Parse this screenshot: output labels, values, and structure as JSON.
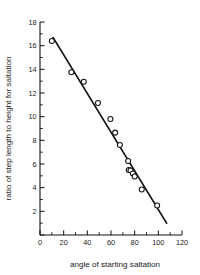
{
  "chart_data": {
    "type": "scatter",
    "title": "",
    "xlabel": "angle of starting saltation",
    "ylabel": "ratio of step length to height for saltation",
    "xlim": [
      0,
      120
    ],
    "ylim": [
      0,
      18
    ],
    "xticks": [
      0,
      20,
      40,
      60,
      80,
      100,
      120
    ],
    "xtick_labels": [
      "0",
      "20",
      "40",
      "60",
      "80",
      "100",
      "120"
    ],
    "xminor_step": 10,
    "yticks": [
      0,
      2,
      4,
      6,
      8,
      10,
      12,
      14,
      16,
      18
    ],
    "ytick_labels": [
      "0",
      "2",
      "4",
      "6",
      "8",
      "10",
      "12",
      "14",
      "16",
      "18"
    ],
    "yminor_step": 1,
    "ytick_labels_shown": [
      "2",
      "4",
      "6",
      "8",
      "10",
      "12",
      "14",
      "16",
      "18"
    ],
    "grid": false,
    "legend": false,
    "marker": "open-circle",
    "points": [
      {
        "x": 10.0,
        "y": 16.4
      },
      {
        "x": 26.5,
        "y": 13.75
      },
      {
        "x": 37.0,
        "y": 12.95
      },
      {
        "x": 49.0,
        "y": 11.15
      },
      {
        "x": 59.5,
        "y": 9.8
      },
      {
        "x": 63.5,
        "y": 8.65
      },
      {
        "x": 67.5,
        "y": 7.6
      },
      {
        "x": 74.5,
        "y": 6.25
      },
      {
        "x": 75.0,
        "y": 5.5
      },
      {
        "x": 76.5,
        "y": 5.45
      },
      {
        "x": 78.5,
        "y": 5.2
      },
      {
        "x": 80.0,
        "y": 4.95
      },
      {
        "x": 86.0,
        "y": 3.85
      },
      {
        "x": 99.0,
        "y": 2.5
      }
    ],
    "fit_line": {
      "x_start": 11.0,
      "y_start": 16.7,
      "x_end": 107.0,
      "y_end": 1.0,
      "style": "solid"
    }
  }
}
